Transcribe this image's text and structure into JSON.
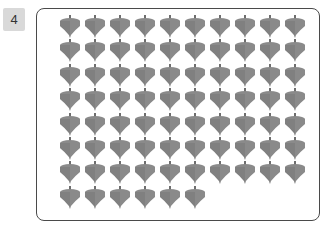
{
  "problem": {
    "number": "4",
    "total_items": 76,
    "columns": 10,
    "full_rows": 7,
    "last_row_count": 6,
    "item_type": "spinning-top",
    "colors": {
      "body": "#8a8a8a",
      "shade": "#6e6e6e",
      "frame": "#4a4a4a",
      "badge": "#d9d9d9"
    }
  }
}
